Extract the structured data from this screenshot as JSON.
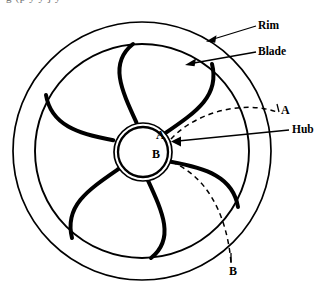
{
  "figure": {
    "kind": "engineering-line-drawing",
    "background_color": "#ffffff",
    "stroke_color": "#000000",
    "cropped_caption_fragment": "g (p y y j y"
  },
  "geometry": {
    "center": {
      "x": 142,
      "y": 151
    },
    "rim_outer_radius": 129,
    "rim_inner_radius": 107,
    "hub_outer_radius": 29,
    "hub_inner_radius": 25,
    "blade_count": 6,
    "blade_curvature": "backward-curved spiral",
    "blade_start_radius": 29,
    "blade_end_radius": 107
  },
  "callouts": [
    {
      "id": "rim",
      "label": "Rim",
      "label_x": 258,
      "label_y": 20,
      "leader_from": {
        "x": 256,
        "y": 26
      },
      "leader_to": {
        "x": 209,
        "y": 41
      },
      "arrow": true
    },
    {
      "id": "blade",
      "label": "Blade",
      "label_x": 258,
      "label_y": 46,
      "leader_from": {
        "x": 256,
        "y": 52
      },
      "leader_to": {
        "x": 187,
        "y": 65
      },
      "arrow": true
    },
    {
      "id": "hub",
      "label": "Hub",
      "label_x": 292,
      "label_y": 124,
      "leader_from": {
        "x": 289,
        "y": 130
      },
      "leader_to": {
        "x": 172,
        "y": 142
      },
      "arrow": true
    }
  ],
  "markers": [
    {
      "id": "a-hub",
      "label": "A",
      "x": 156,
      "y": 129,
      "note": "inner end of path A at hub"
    },
    {
      "id": "b-hub",
      "label": "B",
      "x": 152,
      "y": 148,
      "note": "inner end of path B at hub"
    },
    {
      "id": "a-outer",
      "label": "A",
      "x": 281,
      "y": 104,
      "note": "outer end of dashed path A"
    },
    {
      "id": "b-outer",
      "label": "B",
      "x": 229,
      "y": 265,
      "note": "outer end of dashed path B"
    }
  ],
  "dashed_paths": [
    {
      "id": "path-a",
      "label": "A",
      "description": "dashed arc from hub upper-right to rim, marked A at both ends",
      "style": "dashed"
    },
    {
      "id": "path-b",
      "label": "B",
      "description": "dashed arc from hub lower-right down to rim, marked B at both ends",
      "style": "dashed"
    }
  ]
}
